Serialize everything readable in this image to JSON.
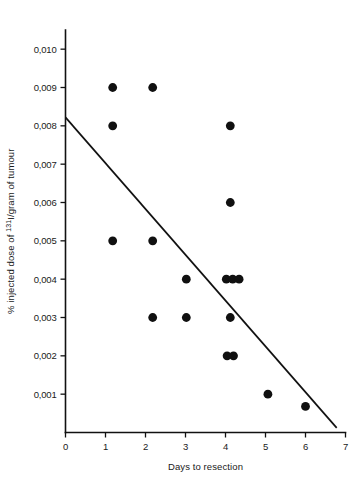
{
  "chart_data": {
    "type": "scatter",
    "title": "",
    "xlabel": "Days to resection",
    "ylabel": "% injected dose of ",
    "ylabel_sup": "131",
    "ylabel_tail": "I/gram of tumour",
    "xlim": [
      0,
      7
    ],
    "ylim": [
      0,
      0.0105
    ],
    "grid": false,
    "legend": false,
    "xticks": [
      0,
      1,
      2,
      3,
      4,
      5,
      6,
      7
    ],
    "xtick_labels": [
      "0",
      "1",
      "2",
      "3",
      "4",
      "5",
      "6",
      "7"
    ],
    "yticks": [
      0.001,
      0.002,
      0.003,
      0.004,
      0.005,
      0.006,
      0.007,
      0.008,
      0.009,
      0.01
    ],
    "ytick_labels": [
      "0,001",
      "0,002",
      "0,003",
      "0,004",
      "0,005",
      "0,006",
      "0,007",
      "0,008",
      "0,009",
      "0,010"
    ],
    "marker_color": "#101010",
    "line_color": "#111111",
    "points": [
      {
        "x": 1.18,
        "y": 0.009
      },
      {
        "x": 2.18,
        "y": 0.009
      },
      {
        "x": 1.18,
        "y": 0.008
      },
      {
        "x": 4.12,
        "y": 0.008
      },
      {
        "x": 4.12,
        "y": 0.006
      },
      {
        "x": 1.18,
        "y": 0.005
      },
      {
        "x": 2.18,
        "y": 0.005
      },
      {
        "x": 3.02,
        "y": 0.004
      },
      {
        "x": 4.02,
        "y": 0.004
      },
      {
        "x": 4.18,
        "y": 0.004
      },
      {
        "x": 4.34,
        "y": 0.004
      },
      {
        "x": 2.18,
        "y": 0.003
      },
      {
        "x": 3.02,
        "y": 0.003
      },
      {
        "x": 4.12,
        "y": 0.003
      },
      {
        "x": 4.04,
        "y": 0.002
      },
      {
        "x": 4.2,
        "y": 0.002
      },
      {
        "x": 5.06,
        "y": 0.001
      },
      {
        "x": 6.0,
        "y": 0.00068
      }
    ],
    "trend_line": {
      "x1": 0.0,
      "y1": 0.00822,
      "x2": 6.78,
      "y2": 0.00012
    }
  }
}
